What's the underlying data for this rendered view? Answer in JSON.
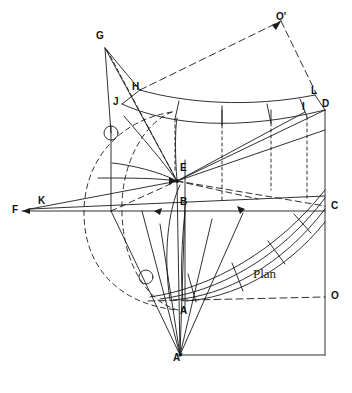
{
  "figure": {
    "type": "descriptive-geometry-plan-drawing",
    "caption_text": "Plan",
    "background_color": "#ffffff",
    "line_color": "#1a1a1a"
  },
  "labels": [
    {
      "id": "G",
      "text": "G",
      "x": 96,
      "y": 31
    },
    {
      "id": "Oprime",
      "text": "O'",
      "x": 276,
      "y": 12
    },
    {
      "id": "H",
      "text": "H",
      "x": 132,
      "y": 82
    },
    {
      "id": "J",
      "text": "J",
      "x": 113,
      "y": 97
    },
    {
      "id": "L",
      "text": "L",
      "x": 311,
      "y": 86
    },
    {
      "id": "D",
      "text": "D",
      "x": 322,
      "y": 99
    },
    {
      "id": "I",
      "text": "I",
      "x": 302,
      "y": 102
    },
    {
      "id": "E",
      "text": "E",
      "x": 180,
      "y": 163
    },
    {
      "id": "K",
      "text": "K",
      "x": 38,
      "y": 196
    },
    {
      "id": "F",
      "text": "F",
      "x": 12,
      "y": 205
    },
    {
      "id": "B",
      "text": "B",
      "x": 180,
      "y": 197
    },
    {
      "id": "C",
      "text": "C",
      "x": 331,
      "y": 201
    },
    {
      "id": "O",
      "text": "O",
      "x": 331,
      "y": 291
    },
    {
      "id": "A",
      "text": "A",
      "x": 180,
      "y": 306
    },
    {
      "id": "Aprime",
      "text": "A'",
      "x": 173,
      "y": 353
    }
  ],
  "plan_label": {
    "text": "Plan",
    "x": 253,
    "y": 266
  },
  "points": {
    "G": {
      "x": 105,
      "y": 48
    },
    "Oprime": {
      "x": 281,
      "y": 21
    },
    "H": {
      "x": 140,
      "y": 90
    },
    "J": {
      "x": 122,
      "y": 104
    },
    "L": {
      "x": 315,
      "y": 95
    },
    "D": {
      "x": 325,
      "y": 110
    },
    "I": {
      "x": 305,
      "y": 112
    },
    "E": {
      "x": 177,
      "y": 181
    },
    "K": {
      "x": 46,
      "y": 207
    },
    "F": {
      "x": 22,
      "y": 211
    },
    "B": {
      "x": 185,
      "y": 211
    },
    "C": {
      "x": 325,
      "y": 211
    },
    "O": {
      "x": 325,
      "y": 297
    },
    "A": {
      "x": 185,
      "y": 301
    },
    "Aprime": {
      "x": 180,
      "y": 355
    }
  },
  "circles": [
    {
      "name": "upper-marker-circle",
      "cx": 111,
      "cy": 133,
      "r": 7
    },
    {
      "name": "lower-marker-circle",
      "cx": 146,
      "cy": 277,
      "r": 7
    }
  ]
}
